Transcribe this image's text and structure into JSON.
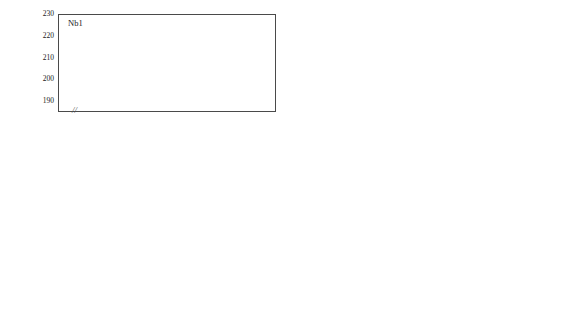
{
  "figure": {
    "axis_title_y": "H (HV)",
    "axis_title_x": "Aging time (min)",
    "axis_break_glyph": "//",
    "xticks": [
      "0",
      "1",
      "10",
      "100",
      "1000",
      "10000"
    ],
    "colors": {
      "series_630": "#111111",
      "series_580": "#6f6f6f",
      "series_530": "#8a8a8a",
      "axis": "#4a4a4a",
      "background": "#ffffff"
    }
  },
  "legend": {
    "items": [
      {
        "label": "630°C",
        "marker": "triangle",
        "color": "#111111"
      },
      {
        "label": "580°C",
        "marker": "square",
        "color": "#6f6f6f"
      },
      {
        "label": "530°C",
        "marker": "square",
        "color": "#8a8a8a"
      }
    ]
  },
  "chart_data": [
    {
      "type": "line",
      "title": "Nb1",
      "xlabel": "Aging time (min)",
      "ylabel": "H (HV)",
      "ylim": [
        185,
        230
      ],
      "yticks": [
        190,
        200,
        210,
        220,
        230
      ],
      "xlim_log": [
        0.5,
        20000
      ],
      "xticks": [
        1,
        10,
        100,
        1000,
        10000
      ],
      "x_break": true,
      "grid": false,
      "series": [
        {
          "name": "630°C",
          "marker": "triangle",
          "color": "#111111",
          "connected": true,
          "points": [
            {
              "x": 0,
              "y": 199.0,
              "err": 1.5
            },
            {
              "x": 2,
              "y": 204.5,
              "err": 7.0
            },
            {
              "x": 4,
              "y": 209.5,
              "err": 7.0
            },
            {
              "x": 6,
              "y": 215.5,
              "err": 7.0
            },
            {
              "x": 12,
              "y": 219.5,
              "err": 7.5
            },
            {
              "x": 20,
              "y": 220.5,
              "err": 7.0
            },
            {
              "x": 60,
              "y": 216.0,
              "err": 7.0
            },
            {
              "x": 380,
              "y": 205.5,
              "err": 5.0
            }
          ]
        },
        {
          "name": "580°C",
          "marker": "square",
          "color": "#6f6f6f",
          "connected": true,
          "points": [
            {
              "x": 0,
              "y": 199.0,
              "err": 1.5
            },
            {
              "x": 2,
              "y": 204.5,
              "err": 7.0
            },
            {
              "x": 6,
              "y": 205.0,
              "err": 6.0
            },
            {
              "x": 10,
              "y": 207.0,
              "err": 4.0
            },
            {
              "x": 20,
              "y": 213.5,
              "err": 5.0
            },
            {
              "x": 60,
              "y": 216.0,
              "err": 7.0
            },
            {
              "x": 160,
              "y": 210.5,
              "err": 6.0
            },
            {
              "x": 380,
              "y": 205.5,
              "err": 6.0
            },
            {
              "x": 1000,
              "y": 205.0,
              "err": 6.0
            },
            {
              "x": 3800,
              "y": 200.0,
              "err": 6.0
            },
            {
              "x": 13000,
              "y": 194.5,
              "err": 6.0
            }
          ]
        },
        {
          "name": "530°C",
          "marker": "square",
          "color": "#8a8a8a",
          "connected": false,
          "points": [
            {
              "x": 60,
              "y": 221.0,
              "err": 6.0
            },
            {
              "x": 110,
              "y": 221.0,
              "err": 7.0
            },
            {
              "x": 200,
              "y": 215.5,
              "err": 7.0
            },
            {
              "x": 380,
              "y": 215.5,
              "err": 5.0
            },
            {
              "x": 420,
              "y": 209.5,
              "err": 5.0
            },
            {
              "x": 900,
              "y": 219.5,
              "err": 5.0
            },
            {
              "x": 1900,
              "y": 223.5,
              "err": 4.0
            },
            {
              "x": 2400,
              "y": 212.5,
              "err": 4.0
            },
            {
              "x": 4200,
              "y": 207.0,
              "err": 4.0
            },
            {
              "x": 7500,
              "y": 206.5,
              "err": 4.0
            },
            {
              "x": 15000,
              "y": 205.0,
              "err": 4.0
            }
          ]
        }
      ]
    },
    {
      "type": "line",
      "title": "Nb1Mo2",
      "xlabel": "Aging time (min)",
      "ylabel": "H (HV)",
      "ylim": [
        197,
        250
      ],
      "yticks": [
        200,
        210,
        220,
        230,
        240,
        250
      ],
      "xlim_log": [
        0.5,
        20000
      ],
      "xticks": [
        1,
        10,
        100,
        1000,
        10000
      ],
      "x_break": true,
      "grid": false,
      "series": [
        {
          "name": "630°C",
          "marker": "triangle",
          "color": "#111111",
          "connected": true,
          "points": [
            {
              "x": 0,
              "y": 210.0,
              "err": 2.0
            },
            {
              "x": 2,
              "y": 213.0,
              "err": 5.0
            },
            {
              "x": 4,
              "y": 224.5,
              "err": 7.0
            },
            {
              "x": 6,
              "y": 230.5,
              "err": 8.0
            },
            {
              "x": 12,
              "y": 237.0,
              "err": 7.0
            },
            {
              "x": 20,
              "y": 240.5,
              "err": 7.0
            },
            {
              "x": 40,
              "y": 236.5,
              "err": 8.0
            },
            {
              "x": 110,
              "y": 236.0,
              "err": 8.0
            },
            {
              "x": 380,
              "y": 224.0,
              "err": 7.0
            }
          ]
        },
        {
          "name": "580°C",
          "marker": "square",
          "color": "#6f6f6f",
          "connected": true,
          "points": [
            {
              "x": 0,
              "y": 210.0,
              "err": 2.0
            },
            {
              "x": 2,
              "y": 213.0,
              "err": 5.0
            },
            {
              "x": 6,
              "y": 213.5,
              "err": 7.0
            },
            {
              "x": 10,
              "y": 215.5,
              "err": 5.0
            },
            {
              "x": 20,
              "y": 223.5,
              "err": 7.0
            },
            {
              "x": 40,
              "y": 229.5,
              "err": 7.0
            },
            {
              "x": 110,
              "y": 239.5,
              "err": 7.0
            },
            {
              "x": 140,
              "y": 238.0,
              "err": 5.0
            },
            {
              "x": 200,
              "y": 235.5,
              "err": 6.0
            },
            {
              "x": 380,
              "y": 232.0,
              "err": 7.0
            },
            {
              "x": 1000,
              "y": 226.5,
              "err": 7.0
            },
            {
              "x": 3000,
              "y": 222.0,
              "err": 6.0
            },
            {
              "x": 13000,
              "y": 212.0,
              "err": 6.0
            }
          ]
        },
        {
          "name": "530°C",
          "marker": "square",
          "color": "#8a8a8a",
          "connected": false,
          "points": [
            {
              "x": 100,
              "y": 218.0,
              "err": 7.0
            },
            {
              "x": 380,
              "y": 232.0,
              "err": 5.0
            },
            {
              "x": 900,
              "y": 240.5,
              "err": 4.0
            },
            {
              "x": 1900,
              "y": 238.5,
              "err": 4.0
            },
            {
              "x": 3400,
              "y": 229.5,
              "err": 4.0
            },
            {
              "x": 6000,
              "y": 225.0,
              "err": 4.0
            },
            {
              "x": 8500,
              "y": 224.0,
              "err": 4.0
            },
            {
              "x": 15000,
              "y": 214.5,
              "err": 4.0
            }
          ]
        }
      ]
    },
    {
      "type": "line",
      "title": "Nb1Mo1",
      "xlabel": "Aging time (min)",
      "ylabel": "H (HV)",
      "ylim": [
        197,
        250
      ],
      "yticks": [
        200,
        210,
        220,
        230,
        240,
        250
      ],
      "xlim_log": [
        0.5,
        20000
      ],
      "xticks": [
        1,
        10,
        100,
        1000,
        10000
      ],
      "x_break": true,
      "grid": false,
      "series": [
        {
          "name": "630°C",
          "marker": "triangle",
          "color": "#111111",
          "connected": true,
          "points": [
            {
              "x": 0,
              "y": 209.5,
              "err": 2.5
            },
            {
              "x": 2,
              "y": 214.0,
              "err": 5.0
            },
            {
              "x": 6,
              "y": 222.0,
              "err": 5.0
            },
            {
              "x": 12,
              "y": 226.5,
              "err": 5.0
            },
            {
              "x": 20,
              "y": 233.0,
              "err": 5.0
            },
            {
              "x": 40,
              "y": 225.5,
              "err": 5.0
            },
            {
              "x": 110,
              "y": 224.5,
              "err": 5.0
            },
            {
              "x": 380,
              "y": 219.5,
              "err": 5.0
            }
          ]
        },
        {
          "name": "580°C",
          "marker": "square",
          "color": "#6f6f6f",
          "connected": true,
          "points": [
            {
              "x": 0,
              "y": 209.0,
              "err": 2.5
            },
            {
              "x": 2,
              "y": 214.0,
              "err": 5.0
            },
            {
              "x": 6,
              "y": 213.0,
              "err": 5.0
            },
            {
              "x": 10,
              "y": 214.0,
              "err": 5.0
            },
            {
              "x": 20,
              "y": 218.0,
              "err": 5.0
            },
            {
              "x": 40,
              "y": 221.0,
              "err": 5.0
            },
            {
              "x": 75,
              "y": 224.5,
              "err": 5.0
            },
            {
              "x": 110,
              "y": 229.0,
              "err": 6.0
            },
            {
              "x": 200,
              "y": 226.5,
              "err": 5.0
            },
            {
              "x": 380,
              "y": 223.0,
              "err": 5.0
            },
            {
              "x": 1000,
              "y": 220.5,
              "err": 5.0
            },
            {
              "x": 3800,
              "y": 212.5,
              "err": 5.0
            },
            {
              "x": 13000,
              "y": 208.5,
              "err": 5.0
            }
          ]
        },
        {
          "name": "530°C",
          "marker": "square",
          "color": "#8a8a8a",
          "connected": false,
          "points": [
            {
              "x": 100,
              "y": 215.5,
              "err": 6.0
            },
            {
              "x": 380,
              "y": 216.0,
              "err": 5.0
            },
            {
              "x": 700,
              "y": 216.5,
              "err": 4.0
            },
            {
              "x": 1400,
              "y": 229.0,
              "err": 4.0
            },
            {
              "x": 2400,
              "y": 226.0,
              "err": 4.0
            },
            {
              "x": 4200,
              "y": 223.5,
              "err": 4.0
            },
            {
              "x": 8000,
              "y": 221.5,
              "err": 4.0
            },
            {
              "x": 15000,
              "y": 216.0,
              "err": 4.0
            }
          ]
        }
      ]
    },
    {
      "type": "line",
      "title": "Nb2Mo2",
      "xlabel": "Aging time (min)",
      "ylabel": "H (HV)",
      "ylim": [
        207,
        260
      ],
      "yticks": [
        210,
        220,
        230,
        240,
        250,
        260
      ],
      "xlim_log": [
        0.5,
        20000
      ],
      "xticks": [
        1,
        10,
        100,
        1000,
        10000
      ],
      "x_break": true,
      "grid": false,
      "series": [
        {
          "name": "630°C",
          "marker": "triangle",
          "color": "#111111",
          "connected": true,
          "points": [
            {
              "x": 0,
              "y": 224.0,
              "err": 2.5
            },
            {
              "x": 2,
              "y": 230.5,
              "err": 6.0
            },
            {
              "x": 4,
              "y": 235.0,
              "err": 6.0
            },
            {
              "x": 6,
              "y": 243.5,
              "err": 6.0
            },
            {
              "x": 12,
              "y": 249.5,
              "err": 8.0
            },
            {
              "x": 20,
              "y": 255.5,
              "err": 6.0
            },
            {
              "x": 40,
              "y": 249.0,
              "err": 6.0
            },
            {
              "x": 75,
              "y": 247.5,
              "err": 6.0
            },
            {
              "x": 110,
              "y": 247.0,
              "err": 6.0
            },
            {
              "x": 380,
              "y": 245.5,
              "err": 6.0
            }
          ]
        },
        {
          "name": "580°C",
          "marker": "square",
          "color": "#6f6f6f",
          "connected": true,
          "points": [
            {
              "x": 0,
              "y": 226.5,
              "err": 2.5
            },
            {
              "x": 2,
              "y": 230.0,
              "err": 6.0
            },
            {
              "x": 6,
              "y": 229.5,
              "err": 6.0
            },
            {
              "x": 10,
              "y": 228.0,
              "err": 6.0
            },
            {
              "x": 20,
              "y": 234.0,
              "err": 7.0
            },
            {
              "x": 40,
              "y": 241.0,
              "err": 7.0
            },
            {
              "x": 75,
              "y": 247.5,
              "err": 6.0
            },
            {
              "x": 110,
              "y": 252.5,
              "err": 5.0
            },
            {
              "x": 200,
              "y": 249.0,
              "err": 5.0
            },
            {
              "x": 380,
              "y": 241.0,
              "err": 5.0
            },
            {
              "x": 1000,
              "y": 242.0,
              "err": 5.0
            },
            {
              "x": 3400,
              "y": 238.5,
              "err": 5.0
            },
            {
              "x": 13000,
              "y": 227.5,
              "err": 7.0
            }
          ]
        },
        {
          "name": "530°C",
          "marker": "square",
          "color": "#8a8a8a",
          "connected": false,
          "points": [
            {
              "x": 100,
              "y": 231.5,
              "err": 6.0
            },
            {
              "x": 380,
              "y": 246.0,
              "err": 5.0
            },
            {
              "x": 700,
              "y": 250.5,
              "err": 4.0
            },
            {
              "x": 1200,
              "y": 254.5,
              "err": 4.0
            },
            {
              "x": 1900,
              "y": 248.0,
              "err": 4.0
            },
            {
              "x": 3800,
              "y": 242.5,
              "err": 4.0
            },
            {
              "x": 7500,
              "y": 238.5,
              "err": 4.0
            },
            {
              "x": 15000,
              "y": 234.0,
              "err": 4.0
            }
          ]
        }
      ]
    }
  ]
}
